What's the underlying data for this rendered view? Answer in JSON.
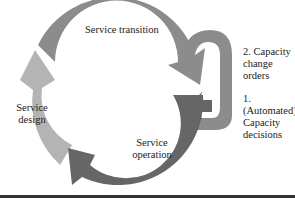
{
  "diagram": {
    "type": "cycle",
    "colors": {
      "service_design": "#b4b4b4",
      "service_transition": "#8c8c8c",
      "service_operation": "#666666",
      "feedback_loop": "#8c8c8c",
      "text": "#222222",
      "rule": "#333333"
    },
    "stages": [
      {
        "label_line1": "Service transition",
        "label_line2": ""
      },
      {
        "label_line1": "Service",
        "label_line2": "operation"
      },
      {
        "label_line1": "Service",
        "label_line2": "design"
      }
    ],
    "loop_labels": [
      {
        "line1": "2. Capacity",
        "line2": "change",
        "line3": "orders"
      },
      {
        "line1": "1. (Automated)",
        "line2": "Capacity",
        "line3": "decisions"
      }
    ]
  }
}
